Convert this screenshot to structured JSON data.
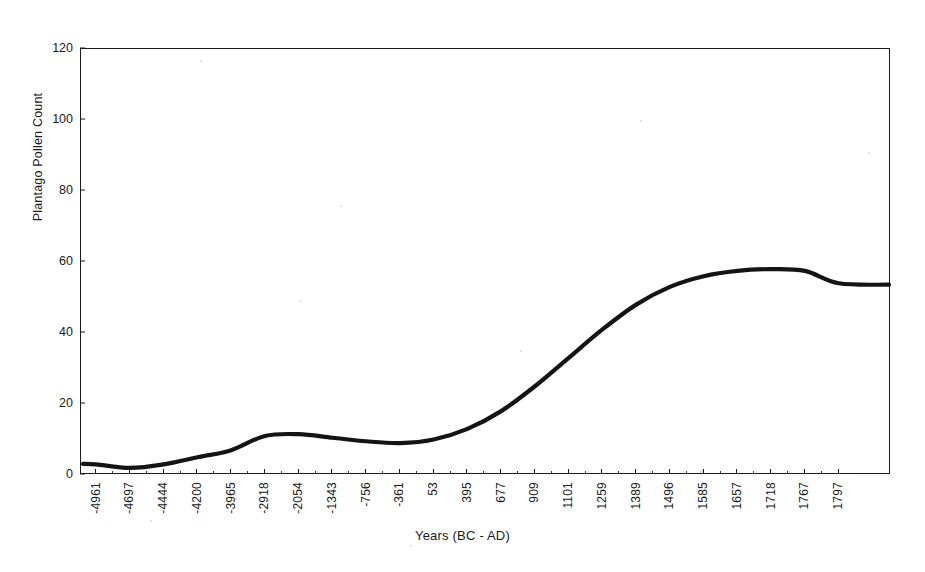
{
  "figure": {
    "background_color": "#ffffff",
    "frame_color": "#1b1b1b",
    "series_color": "#141414"
  },
  "chart_data": {
    "type": "line",
    "title": "",
    "xlabel": "Years (BC - AD)",
    "ylabel": "Plantago Pollen Count",
    "ylim": [
      0,
      120
    ],
    "ytick_labels": [
      "0",
      "20",
      "40",
      "60",
      "80",
      "100",
      "120"
    ],
    "ytick_values": [
      0,
      20,
      40,
      60,
      80,
      100,
      120
    ],
    "grid": false,
    "legend": null,
    "categories": [
      "-4961",
      "-4697",
      "-4444",
      "-4200",
      "-3965",
      "-2918",
      "-2054",
      "-1343",
      "-756",
      "-361",
      "53",
      "395",
      "677",
      "909",
      "1101",
      "1259",
      "1389",
      "1496",
      "1585",
      "1657",
      "1718",
      "1767",
      "1797"
    ],
    "values": [
      3,
      2,
      3,
      5,
      7,
      11,
      11.5,
      10.5,
      9.5,
      9,
      10,
      13,
      18,
      25,
      33,
      41,
      48,
      53,
      56,
      57.5,
      58,
      57.5,
      54
    ],
    "series": [
      {
        "name": "Plantago Pollen Count",
        "values": [
          3,
          2,
          3,
          5,
          7,
          11,
          11.5,
          10.5,
          9.5,
          9,
          10,
          13,
          18,
          25,
          33,
          41,
          48,
          53,
          56,
          57.5,
          58,
          57.5,
          54
        ]
      }
    ]
  }
}
